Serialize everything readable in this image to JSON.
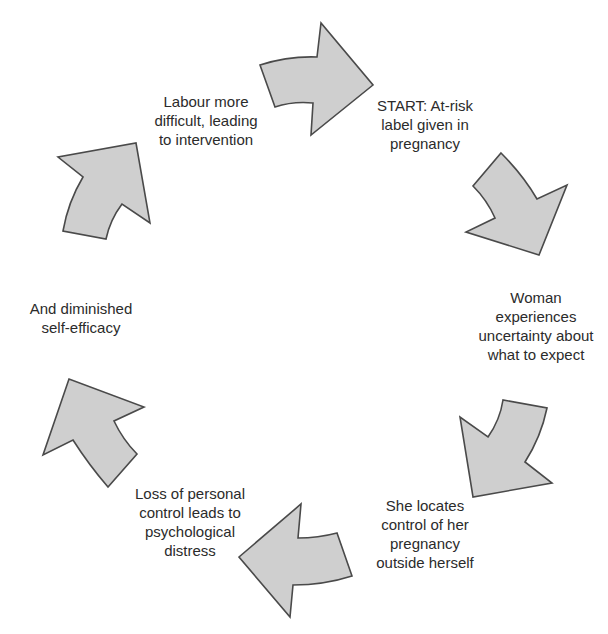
{
  "diagram": {
    "type": "cycle",
    "direction": "clockwise",
    "colors": {
      "arrow_fill": "#cfcfcf",
      "arrow_stroke": "#4a4a4a",
      "text": "#2b2b2b",
      "background": "#ffffff"
    },
    "steps": [
      {
        "id": "start",
        "lines": [
          "START: At-risk",
          "label given in",
          "pregnancy"
        ]
      },
      {
        "id": "uncertainty",
        "lines": [
          "Woman",
          "experiences",
          "uncertainty about",
          "what to expect"
        ]
      },
      {
        "id": "external-control",
        "lines": [
          "She locates",
          "control of her",
          "pregnancy",
          "outside herself"
        ]
      },
      {
        "id": "distress",
        "lines": [
          "Loss of personal",
          "control leads to",
          "psychological",
          "distress"
        ]
      },
      {
        "id": "self-efficacy",
        "lines": [
          "And diminished",
          "self-efficacy"
        ]
      },
      {
        "id": "intervention",
        "lines": [
          "Labour more",
          "difficult, leading",
          "to intervention"
        ]
      }
    ],
    "arrows": [
      {
        "id": "arrow-intervention-to-start",
        "from": "intervention",
        "to": "start"
      },
      {
        "id": "arrow-start-to-uncertainty",
        "from": "start",
        "to": "uncertainty"
      },
      {
        "id": "arrow-uncertainty-to-external-control",
        "from": "uncertainty",
        "to": "external-control"
      },
      {
        "id": "arrow-external-control-to-distress",
        "from": "external-control",
        "to": "distress"
      },
      {
        "id": "arrow-distress-to-self-efficacy",
        "from": "distress",
        "to": "self-efficacy"
      },
      {
        "id": "arrow-self-efficacy-to-intervention",
        "from": "self-efficacy",
        "to": "intervention"
      }
    ]
  }
}
